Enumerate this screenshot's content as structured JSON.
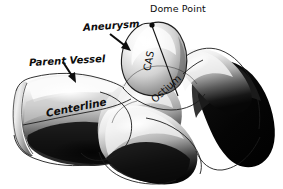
{
  "figure": {
    "kind": "anatomical-illustration",
    "style": "grayscale airbrush line drawing",
    "background_color": "#ffffff",
    "ink_color": "#0d0d0d"
  },
  "labels": {
    "dome_point": "Dome Point",
    "aneurysm": "Aneurysm",
    "parent_vessel": "Parent Vessel",
    "centerline": "Centerline",
    "ostium": "Ostium",
    "cas": "CAS"
  },
  "annotations": {
    "dome_point_marker": "black dot at apex of aneurysm dome",
    "aneurysm_arrow": "arrow pointing down-right to aneurysm sac",
    "parent_vessel_arrow": "arrow pointing down-right to parent vessel wall",
    "cas_line": "straight line from dome point down to ostium plane",
    "centerline_curve": "curve running lengthwise through parent vessel",
    "ostium_curve": "elliptical opening where aneurysm meets parent vessel"
  },
  "palette": {
    "paper": "#ffffff",
    "highlight": "#ffffff",
    "light_gray": "#e3e3e3",
    "mid_gray": "#a8a8a8",
    "dark_gray": "#4a4a4a",
    "shadow": "#141414",
    "outline": "#1a1a1a"
  }
}
